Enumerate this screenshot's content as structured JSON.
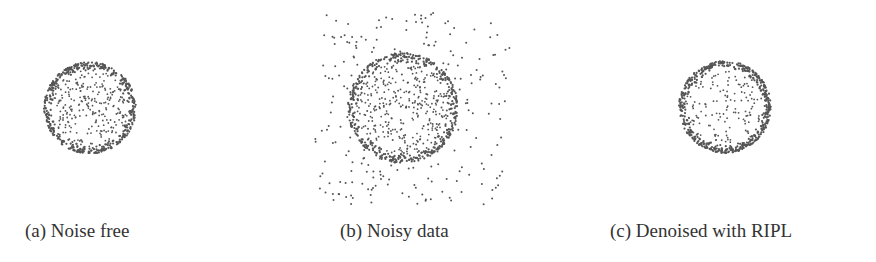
{
  "chart_data": [
    {
      "type": "scatter",
      "title": "(a) Noise free",
      "description": "Points uniformly filling a disk with denser ring near the boundary",
      "center": [
        90,
        108
      ],
      "radius": 46,
      "ring_points": 450,
      "interior_points": 250,
      "outlier_points": 0,
      "outlier_box": null,
      "point_color": "#555555",
      "xlabel": "",
      "ylabel": "",
      "grid": false,
      "axes": false
    },
    {
      "type": "scatter",
      "title": "(b) Noisy data",
      "description": "Ring/disk point cloud with additional uniformly scattered noise points",
      "center": [
        403,
        108
      ],
      "radius": 55,
      "ring_points": 450,
      "interior_points": 300,
      "outlier_points": 260,
      "outlier_box": [
        315,
        12,
        510,
        205
      ],
      "point_color": "#555555",
      "xlabel": "",
      "ylabel": "",
      "grid": false,
      "axes": false
    },
    {
      "type": "scatter",
      "title": "(c) Denoised with RIPL",
      "description": "Denoised circle: dense boundary ring with sparse interior",
      "center": [
        725,
        107
      ],
      "radius": 46,
      "ring_points": 520,
      "interior_points": 140,
      "outlier_points": 0,
      "outlier_box": null,
      "point_color": "#555555",
      "xlabel": "",
      "ylabel": "",
      "grid": false,
      "axes": false
    }
  ],
  "captions": {
    "a": "(a) Noise free",
    "b": "(b) Noisy data",
    "c": "(c) Denoised with RIPL"
  }
}
